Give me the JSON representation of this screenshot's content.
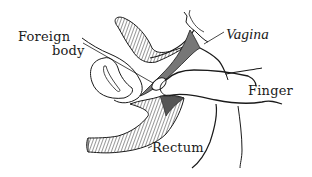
{
  "diagram": {
    "type": "anatomical-illustration",
    "labels": {
      "foreign_body_line1": "Foreign",
      "foreign_body_line2": "body",
      "vagina": "Vagina",
      "finger": "Finger",
      "rectum": "Rectum"
    },
    "colors": {
      "ink": "#1a1a1a",
      "background": "#ffffff"
    }
  }
}
